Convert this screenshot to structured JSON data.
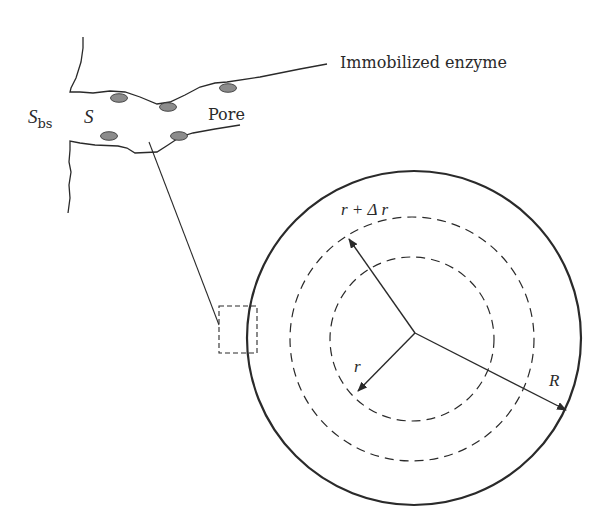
{
  "figure": {
    "type": "diagram",
    "pore_detail": {
      "labels": {
        "bulk_substrate_main": "S",
        "bulk_substrate_sub": "bs",
        "substrate": "S",
        "pore": "Pore",
        "immobilized_enzyme": "Immobilized enzyme"
      },
      "enzyme_count": 5,
      "enzyme_color": "#8c8c8c"
    },
    "particle": {
      "labels": {
        "shell_radius": "r + Δ r",
        "inner_radius": "r",
        "particle_radius": "R"
      },
      "outer_circle": {
        "cx": 414,
        "cy": 338,
        "r": 167
      },
      "dashed_outer": {
        "cx": 412,
        "cy": 339,
        "r": 122
      },
      "dashed_inner": {
        "cx": 412,
        "cy": 339,
        "r": 82
      }
    },
    "colors": {
      "line": "#2a2a2a",
      "enzyme_fill": "#8c8c8c",
      "background": "#ffffff"
    }
  }
}
